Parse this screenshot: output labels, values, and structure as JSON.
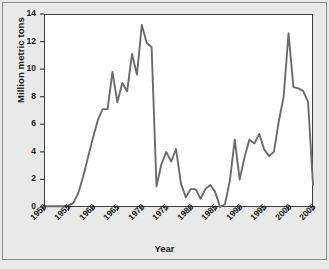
{
  "chart_data": {
    "type": "line",
    "title": "",
    "xlabel": "Year",
    "ylabel": "Million metric tons",
    "xlim": [
      1950,
      2005
    ],
    "ylim": [
      0,
      14
    ],
    "grid": false,
    "legend": null,
    "xticks": [
      1950,
      1955,
      1960,
      1965,
      1970,
      1975,
      1980,
      1985,
      1990,
      1995,
      2000,
      2005
    ],
    "yticks": [
      0,
      2,
      4,
      6,
      8,
      10,
      12,
      14
    ],
    "xtick_labels": [
      "1950",
      "1955",
      "1960",
      "1965",
      "1970",
      "1975",
      "1980",
      "1985",
      "1990",
      "1995",
      "2000",
      "2005"
    ],
    "ytick_labels": [
      "0",
      "2",
      "4",
      "6",
      "8",
      "10",
      "12",
      "14"
    ],
    "series": [
      {
        "name": "Million metric tons",
        "color": "#6b6b6b",
        "x": [
          1950,
          1951,
          1952,
          1953,
          1954,
          1955,
          1956,
          1957,
          1958,
          1959,
          1960,
          1961,
          1962,
          1963,
          1964,
          1965,
          1966,
          1967,
          1968,
          1969,
          1970,
          1971,
          1972,
          1973,
          1974,
          1975,
          1976,
          1977,
          1978,
          1979,
          1980,
          1981,
          1982,
          1983,
          1984,
          1985,
          1986,
          1987,
          1988,
          1989,
          1990,
          1991,
          1992,
          1993,
          1994,
          1995,
          1996,
          1997,
          1998,
          1999,
          2000,
          2001,
          2002,
          2003,
          2004,
          2005
        ],
        "y": [
          0.05,
          0.05,
          0.05,
          0.05,
          0.05,
          0.1,
          0.3,
          1.0,
          2.2,
          3.6,
          5.0,
          6.3,
          7.1,
          7.1,
          9.8,
          7.6,
          9.0,
          8.4,
          11.1,
          9.6,
          13.2,
          11.9,
          11.6,
          1.5,
          3.1,
          4.0,
          3.3,
          4.2,
          1.7,
          0.7,
          1.3,
          1.3,
          0.6,
          1.3,
          1.6,
          1.1,
          0.0,
          0.2,
          1.9,
          4.9,
          2.0,
          3.6,
          4.9,
          4.6,
          5.3,
          4.2,
          3.7,
          4.0,
          6.2,
          8.0,
          12.6,
          8.7,
          8.6,
          8.4,
          7.6,
          1.6
        ]
      }
    ],
    "annotations": []
  },
  "axis": {
    "y_title": "Million metric tons",
    "x_title": "Year"
  }
}
